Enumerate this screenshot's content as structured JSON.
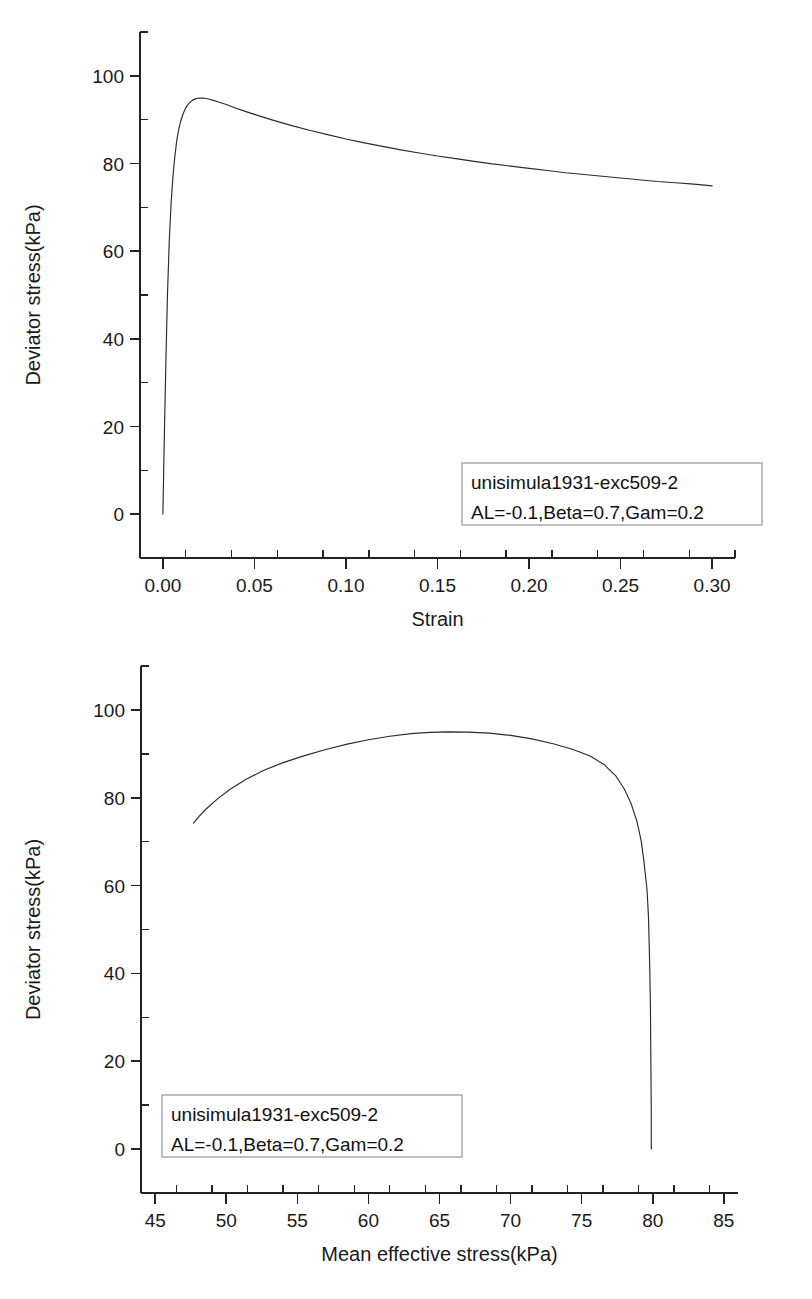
{
  "page": {
    "background": "#ffffff",
    "ink_color": "#222222",
    "curve_color": "#2b2b2b"
  },
  "chart_data": [
    {
      "id": "stress-strain",
      "type": "line",
      "title": "",
      "xlabel": "Strain",
      "ylabel": "Deviator stress(kPa)",
      "xlim": [
        -0.0125,
        0.3125
      ],
      "ylim": [
        -10,
        110
      ],
      "xticks": [
        0.0,
        0.05,
        0.1,
        0.15,
        0.2,
        0.25,
        0.3
      ],
      "xtick_labels": [
        "0.00",
        "0.05",
        "0.10",
        "0.15",
        "0.20",
        "0.25",
        "0.30"
      ],
      "yticks": [
        0,
        20,
        40,
        60,
        80,
        100
      ],
      "ytick_labels": [
        "0",
        "20",
        "40",
        "60",
        "80",
        "100"
      ],
      "x_minor_step": 0.025,
      "y_minor_step": 10,
      "grid": false,
      "legend_position": "lower-right",
      "annotations": [
        "unisimula1931-exc509-2",
        "AL=-0.1,Beta=0.7,Gam=0.2"
      ],
      "series": [
        {
          "name": "unisimula1931-exc509-2",
          "x": [
            0.0,
            0.0008,
            0.0016,
            0.0025,
            0.0035,
            0.0045,
            0.0055,
            0.0065,
            0.0075,
            0.0085,
            0.0095,
            0.011,
            0.0125,
            0.014,
            0.016,
            0.018,
            0.02,
            0.0225,
            0.025,
            0.0275,
            0.03,
            0.035,
            0.04,
            0.045,
            0.05,
            0.06,
            0.07,
            0.08,
            0.09,
            0.1,
            0.11,
            0.12,
            0.13,
            0.14,
            0.15,
            0.16,
            0.17,
            0.18,
            0.19,
            0.2,
            0.21,
            0.22,
            0.23,
            0.24,
            0.25,
            0.26,
            0.27,
            0.28,
            0.29,
            0.3
          ],
          "y": [
            0.0,
            18.0,
            34.0,
            50.0,
            62.5,
            71.0,
            77.0,
            81.5,
            85.0,
            87.5,
            89.3,
            91.3,
            92.7,
            93.6,
            94.4,
            94.8,
            94.95,
            94.9,
            94.7,
            94.4,
            94.1,
            93.4,
            92.6,
            91.9,
            91.2,
            89.9,
            88.7,
            87.6,
            86.6,
            85.6,
            84.7,
            83.9,
            83.1,
            82.4,
            81.7,
            81.1,
            80.5,
            79.9,
            79.4,
            78.9,
            78.4,
            77.9,
            77.5,
            77.1,
            76.7,
            76.3,
            75.9,
            75.6,
            75.3,
            74.9
          ]
        }
      ]
    },
    {
      "id": "stress-path",
      "type": "line",
      "title": "",
      "xlabel": "Mean effective stress(kPa)",
      "ylabel": "Deviator stress(kPa)",
      "xlim": [
        44.0,
        86.0
      ],
      "ylim": [
        -10,
        110
      ],
      "xticks": [
        45,
        50,
        55,
        60,
        65,
        70,
        75,
        80,
        85
      ],
      "xtick_labels": [
        "45",
        "50",
        "55",
        "60",
        "65",
        "70",
        "75",
        "80",
        "85"
      ],
      "yticks": [
        0,
        20,
        40,
        60,
        80,
        100
      ],
      "ytick_labels": [
        "0",
        "20",
        "40",
        "60",
        "80",
        "100"
      ],
      "x_minor_step": 2.5,
      "y_minor_step": 10,
      "grid": false,
      "legend_position": "lower-left",
      "annotations": [
        "unisimula1931-exc509-2",
        "AL=-0.1,Beta=0.7,Gam=0.2"
      ],
      "series": [
        {
          "name": "unisimula1931-exc509-2",
          "x": [
            79.9,
            79.9,
            79.88,
            79.86,
            79.84,
            79.8,
            79.75,
            79.7,
            79.6,
            79.4,
            79.2,
            78.9,
            78.5,
            78.0,
            77.4,
            76.6,
            75.6,
            74.4,
            73.0,
            71.5,
            70.0,
            68.5,
            67.0,
            65.6,
            64.3,
            63.0,
            61.5,
            60.0,
            58.5,
            57.0,
            55.5,
            54.0,
            52.6,
            51.4,
            50.3,
            49.4,
            48.6,
            48.1,
            47.7
          ],
          "y": [
            0.0,
            8.0,
            16.0,
            24.0,
            32.0,
            40.0,
            47.0,
            53.0,
            59.0,
            65.0,
            70.0,
            74.5,
            78.5,
            82.0,
            85.0,
            87.5,
            89.5,
            91.0,
            92.3,
            93.4,
            94.2,
            94.7,
            94.95,
            95.0,
            94.9,
            94.6,
            94.0,
            93.2,
            92.2,
            91.0,
            89.6,
            88.0,
            86.2,
            84.2,
            82.0,
            79.8,
            77.5,
            75.8,
            74.2
          ]
        }
      ]
    }
  ]
}
